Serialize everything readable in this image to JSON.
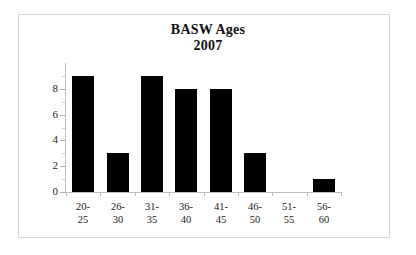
{
  "chart_data": {
    "type": "bar",
    "title": "BASW Ages",
    "subtitle": "2007",
    "title_lines": [
      "BASW Ages",
      "2007"
    ],
    "xlabel": "",
    "ylabel": "",
    "categories": [
      "20-25",
      "26-30",
      "31-35",
      "36-40",
      "41-45",
      "46-50",
      "51-55",
      "56-60"
    ],
    "category_lines": [
      [
        "20-",
        "25"
      ],
      [
        "26-",
        "30"
      ],
      [
        "31-",
        "35"
      ],
      [
        "36-",
        "40"
      ],
      [
        "41-",
        "45"
      ],
      [
        "46-",
        "50"
      ],
      [
        "51-",
        "55"
      ],
      [
        "56-",
        "60"
      ]
    ],
    "values": [
      9,
      3,
      9,
      8,
      8,
      3,
      0,
      1
    ],
    "ylim": [
      0,
      10
    ],
    "ytick_labels": [
      "0",
      "2",
      "4",
      "6",
      "8"
    ],
    "ytick_values": [
      0,
      2,
      4,
      6,
      8
    ],
    "yminor_values": [
      1,
      3,
      5,
      7,
      9
    ],
    "grid": false,
    "legend": false,
    "bar_color": "#000000",
    "axis_color": "#bdbdbd",
    "background_color": "#ffffff",
    "border_color": "#d8d8d8"
  }
}
